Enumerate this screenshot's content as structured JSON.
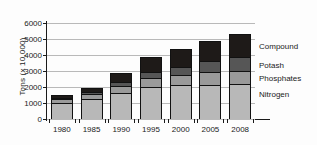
{
  "chart_data": {
    "type": "bar",
    "subtype": "stacked-vertical",
    "title": "",
    "xlabel": "",
    "ylabel": "Tons (x 10,000)",
    "ylim": [
      0,
      6000
    ],
    "ytick_step": 1000,
    "ytick_labels": [
      "0",
      "1000",
      "2000",
      "3000",
      "4000",
      "5000",
      "6000"
    ],
    "grid": true,
    "legend_position": "right",
    "categories": [
      "1980",
      "1985",
      "1990",
      "1995",
      "2000",
      "2005",
      "2008"
    ],
    "series": [
      {
        "name": "Nitrogen",
        "color": "#b8b8b8",
        "values": [
          920,
          1170,
          1540,
          1930,
          2050,
          2090,
          2140
        ]
      },
      {
        "name": "Phosphates",
        "color": "#9a9a9a",
        "values": [
          240,
          300,
          450,
          580,
          620,
          770,
          800
        ]
      },
      {
        "name": "Potash",
        "color": "#565656",
        "values": [
          110,
          150,
          290,
          380,
          520,
          700,
          860
        ]
      },
      {
        "name": "Compound",
        "color": "#1e1a18",
        "values": [
          210,
          330,
          570,
          1000,
          1170,
          1340,
          1530
        ]
      }
    ],
    "totals": [
      1480,
      1950,
      2850,
      3890,
      4360,
      4900,
      5330
    ]
  },
  "legend": {
    "items": [
      {
        "label": "Compound"
      },
      {
        "label": "Potash"
      },
      {
        "label": "Phosphates"
      },
      {
        "label": "Nitrogen"
      }
    ]
  }
}
